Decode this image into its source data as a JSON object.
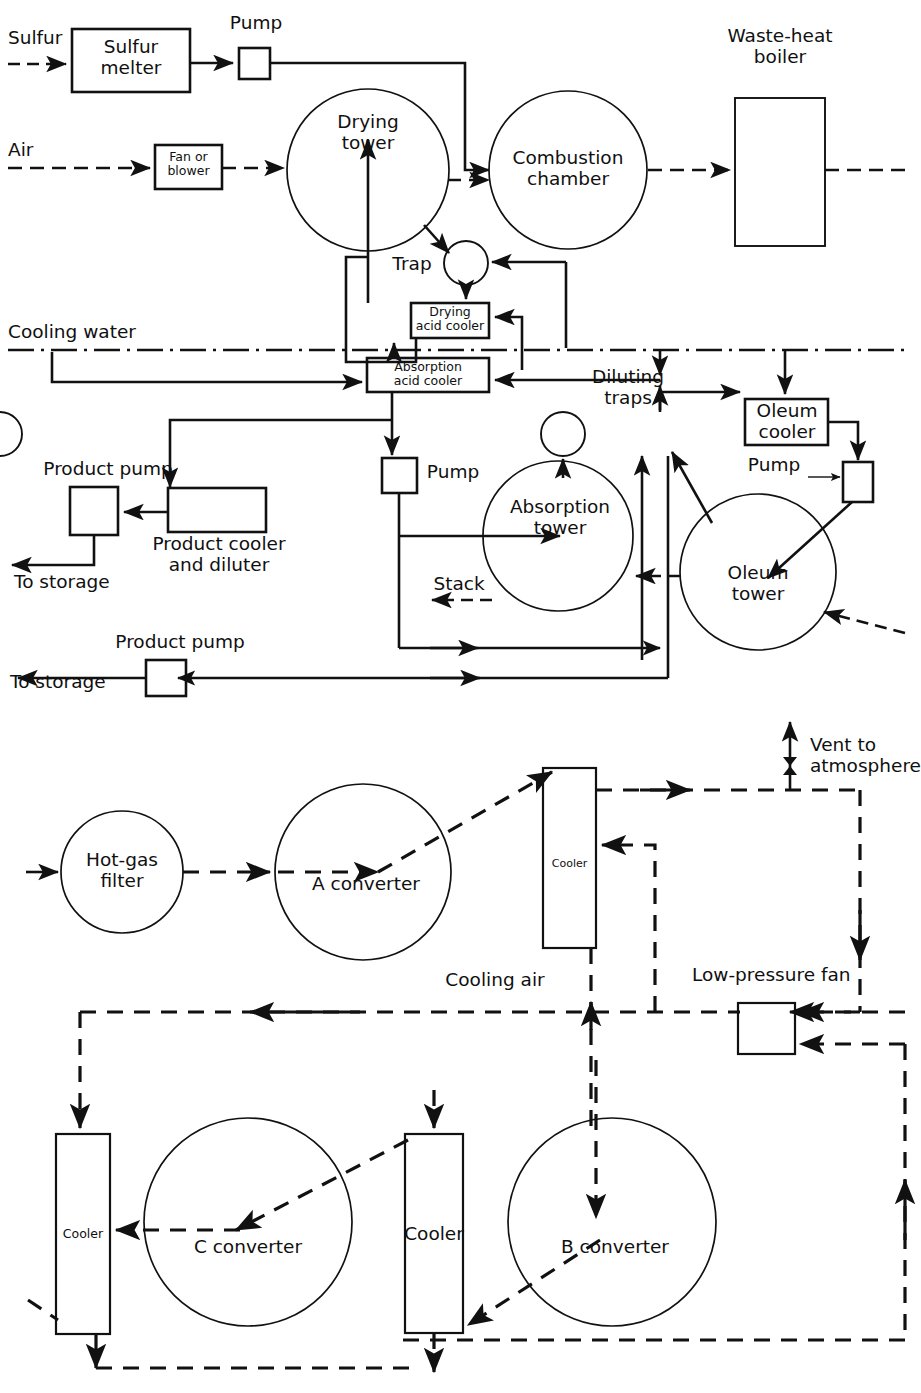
{
  "diagram": {
    "title_absent": true,
    "style": {
      "line_color": "#111111",
      "background": "#ffffff",
      "text_color": "#101010"
    }
  },
  "top_diagram": {
    "name": "sulfur-burning-contact-sulfuric-acid-plant",
    "labels": {
      "sulfur_feed": "Sulfur",
      "sulfur_melter": "Sulfur\nmelter",
      "pump_top": "Pump",
      "air_feed": "Air",
      "fan_or_blower": "Fan or\nblower",
      "drying_tower": "Drying\ntower",
      "combustion_chamber": "Combustion\nchamber",
      "waste_heat_boiler": "Waste-heat\nboiler",
      "trap": "Trap",
      "drying_acid_cooler": "Drying\nacid cooler",
      "cooling_water": "Cooling water",
      "absorption_acid_cooler": "Absorption\nacid cooler",
      "diluting_traps": "Diluting\ntraps",
      "oleum_cooler": "Oleum\ncooler",
      "pump_oleum": "Pump",
      "pump_absorption": "Pump",
      "product_pump_1": "Product pump",
      "product_cooler_and_diluter": "Product cooler\nand diluter",
      "to_storage_1": "To storage",
      "absorption_tower": "Absorption\ntower",
      "stack": "Stack",
      "oleum_tower": "Oleum\ntower",
      "product_pump_2": "Product pump",
      "to_storage_2": "To storage"
    }
  },
  "bottom_diagram": {
    "name": "converter-cooler-train",
    "labels": {
      "hot_gas_filter": "Hot-gas\nfilter",
      "a_converter": "A converter",
      "cooler_a": "Cooler",
      "vent_to_atmosphere": "Vent to\natmosphere",
      "low_pressure_fan": "Low-pressure fan",
      "cooling_air": "Cooling air",
      "cooler_left": "Cooler",
      "c_converter": "C converter",
      "cooler_mid": "Cooler",
      "b_converter": "B converter"
    }
  }
}
